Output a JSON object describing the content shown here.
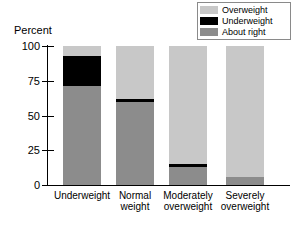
{
  "axis_title": "Percent",
  "legend": {
    "items": [
      {
        "label": "Overweight",
        "color": "#c8c8c8"
      },
      {
        "label": "Underweight",
        "color": "#000000"
      },
      {
        "label": "About right",
        "color": "#8c8c8c"
      }
    ]
  },
  "y_ticks": [
    "100",
    "75",
    "50",
    "25",
    "0"
  ],
  "chart_data": {
    "type": "bar",
    "subtype": "stacked-vertical-100pct",
    "title": "",
    "subtitle": "",
    "xlabel": "",
    "ylabel": "Percent",
    "ylim": [
      0,
      100
    ],
    "yticks": [
      0,
      25,
      50,
      75,
      100
    ],
    "grid": false,
    "legend_position": "top-right",
    "categories": [
      "Underweight",
      "Normal weight",
      "Moderately overweight",
      "Severely overweight"
    ],
    "category_lines": [
      [
        "Underweight"
      ],
      [
        "Normal",
        "weight"
      ],
      [
        "Moderately",
        "overweight"
      ],
      [
        "Severely",
        "overweight"
      ]
    ],
    "series": [
      {
        "name": "About right",
        "color": "#8c8c8c",
        "values": [
          71,
          60,
          13,
          6
        ]
      },
      {
        "name": "Underweight",
        "color": "#000000",
        "values": [
          22,
          2,
          2,
          0
        ]
      },
      {
        "name": "Overweight",
        "color": "#c8c8c8",
        "values": [
          7,
          38,
          85,
          94
        ]
      }
    ]
  }
}
